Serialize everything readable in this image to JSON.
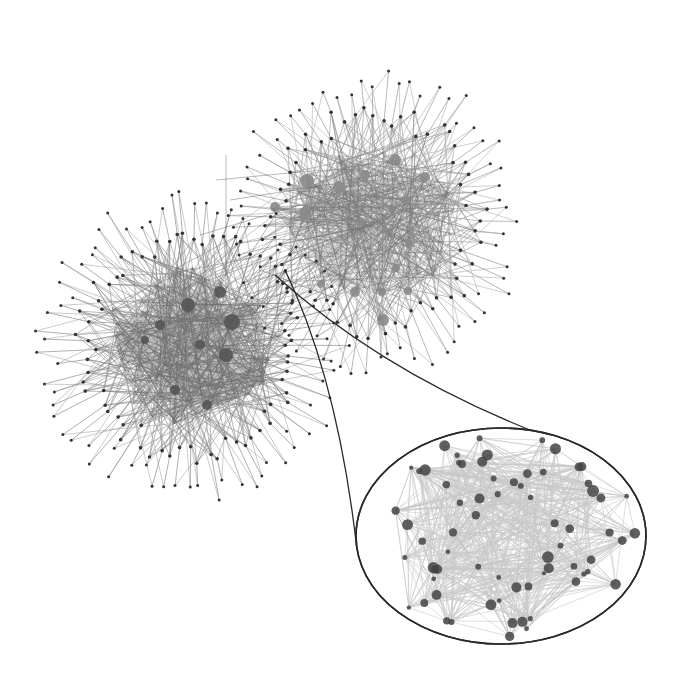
{
  "diagram": {
    "type": "network-graph",
    "background": "#ffffff",
    "colors": {
      "edge": "#3a3a3a",
      "hub_node_left": "#555555",
      "hub_node_right": "#8a8a8a",
      "leaf_node": "#333333",
      "inset_border": "#2a2a2a"
    },
    "clusters": [
      {
        "id": "left-cluster",
        "center": [
          192,
          345
        ],
        "core_radius": [
          95,
          80
        ],
        "outer_radius": [
          150,
          150
        ],
        "spike_count": 72,
        "internal_edges": 900,
        "edge_opacity": 0.35,
        "seed": 11,
        "hubs": [
          [
            188,
            305,
            7
          ],
          [
            232,
            322,
            8
          ],
          [
            220,
            292,
            6
          ],
          [
            226,
            355,
            7
          ],
          [
            160,
            325,
            5
          ],
          [
            200,
            345,
            5
          ],
          [
            175,
            390,
            5
          ],
          [
            207,
            405,
            5
          ],
          [
            145,
            340,
            4
          ]
        ],
        "hub_color": "#555555"
      },
      {
        "id": "right-cluster",
        "center": [
          375,
          220
        ],
        "core_radius": [
          90,
          75
        ],
        "outer_radius": [
          145,
          150
        ],
        "spike_count": 66,
        "internal_edges": 520,
        "edge_opacity": 0.3,
        "seed": 29,
        "hubs": [
          [
            307,
            181,
            7
          ],
          [
            339,
            187,
            6
          ],
          [
            395,
            160,
            6
          ],
          [
            425,
            177,
            5
          ],
          [
            275,
            207,
            5
          ],
          [
            305,
            213,
            6
          ],
          [
            361,
            222,
            4
          ],
          [
            406,
            200,
            4
          ],
          [
            409,
            244,
            4
          ],
          [
            396,
            268,
            4
          ],
          [
            355,
            292,
            5
          ],
          [
            382,
            292,
            4
          ],
          [
            408,
            291,
            4
          ],
          [
            383,
            320,
            6
          ],
          [
            365,
            175,
            5
          ],
          [
            321,
            284,
            4
          ]
        ],
        "hub_color": "#8a8a8a"
      }
    ],
    "inset": {
      "id": "zoom-inset",
      "center": [
        501,
        536
      ],
      "radius": [
        145,
        108
      ],
      "internal_edges": 700,
      "node_count": 70,
      "seed": 53,
      "source_node": [
        285,
        270
      ],
      "connectors": [
        {
          "from": [
            285,
            270
          ],
          "via": [
            338,
            380
          ],
          "to": [
            357,
            550
          ]
        },
        {
          "from": [
            275,
            275
          ],
          "via": [
            380,
            370
          ],
          "to": [
            530,
            430
          ]
        }
      ]
    },
    "bridge_edges": [
      [
        [
          226,
          155
        ],
        [
          226,
          300
        ]
      ],
      [
        [
          216,
          180
        ],
        [
          300,
          172
        ]
      ],
      [
        [
          230,
          200
        ],
        [
          320,
          186
        ]
      ],
      [
        [
          200,
          235
        ],
        [
          300,
          205
        ]
      ],
      [
        [
          260,
          270
        ],
        [
          340,
          300
        ]
      ],
      [
        [
          245,
          260
        ],
        [
          310,
          230
        ]
      ]
    ]
  }
}
